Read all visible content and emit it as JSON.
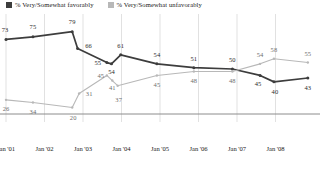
{
  "legend": {
    "position": "top-left",
    "entries": [
      {
        "label": "% Very/Somewhat favorably",
        "color": "#3d3d3d",
        "name": "favorable"
      },
      {
        "label": "% Very/Somewhat unfavorably",
        "color": "#b8b8b8",
        "name": "unfavorable"
      }
    ]
  },
  "chart_data": {
    "type": "line",
    "title": "",
    "subtitle": "",
    "xlabel": "",
    "ylabel": "",
    "grid": true,
    "xlim": [
      0,
      8
    ],
    "ylim": [
      15,
      85
    ],
    "categories": [
      "Jan '01",
      "Jan '02",
      "Jan '03",
      "Jan '04",
      "Jan '05",
      "Jan '06",
      "Jan '07",
      "Jan '08"
    ],
    "tick_labels": [
      "Jan '01",
      "Jan '02",
      "Jan '03",
      "Jan '04",
      "Jan '05",
      "Jan '06",
      "Jan '07",
      "Jan '08"
    ],
    "series": [
      {
        "name": "% Very/Somewhat favorably",
        "color": "#3d3d3d",
        "points": [
          {
            "x": 0.0,
            "y": 73,
            "label": "73",
            "lx": -1,
            "ly": -9
          },
          {
            "x": 0.7,
            "y": 75,
            "label": "75",
            "lx": 0,
            "ly": -10
          },
          {
            "x": 1.72,
            "y": 79,
            "label": "79",
            "lx": 0,
            "ly": -10
          },
          {
            "x": 1.86,
            "y": 66,
            "label": "66",
            "lx": 11,
            "ly": -2
          },
          {
            "x": 2.62,
            "y": 55,
            "label": "55",
            "lx": -9,
            "ly": 0
          },
          {
            "x": 2.74,
            "y": 54,
            "label": "54",
            "lx": 0,
            "ly": 8
          },
          {
            "x": 2.98,
            "y": 61,
            "label": "61",
            "lx": 0,
            "ly": -9
          },
          {
            "x": 3.92,
            "y": 54,
            "label": "54",
            "lx": 0,
            "ly": -9
          },
          {
            "x": 4.88,
            "y": 51,
            "label": "51",
            "lx": 0,
            "ly": -9
          },
          {
            "x": 5.88,
            "y": 50,
            "label": "50",
            "lx": 0,
            "ly": -9
          },
          {
            "x": 6.6,
            "y": 45,
            "label": "45",
            "lx": -2,
            "ly": 9
          },
          {
            "x": 6.96,
            "y": 40,
            "label": "40",
            "lx": 1,
            "ly": 10
          },
          {
            "x": 7.84,
            "y": 43,
            "label": "43",
            "lx": 0,
            "ly": 10
          }
        ]
      },
      {
        "name": "% Very/Somewhat unfavorably",
        "color": "#b8b8b8",
        "points": [
          {
            "x": 0.0,
            "y": 26,
            "label": "26",
            "lx": 0,
            "ly": 9
          },
          {
            "x": 0.7,
            "y": 24,
            "label": "34",
            "lx": 0,
            "ly": 10
          },
          {
            "x": 1.72,
            "y": 20,
            "label": "20",
            "lx": 1,
            "ly": 10
          },
          {
            "x": 1.9,
            "y": 31,
            "label": "31",
            "lx": 10,
            "ly": 1
          },
          {
            "x": 2.62,
            "y": 45,
            "label": "45",
            "lx": -6,
            "ly": 1
          },
          {
            "x": 2.76,
            "y": 41,
            "label": "41",
            "lx": 0,
            "ly": 7
          },
          {
            "x": 2.9,
            "y": 37,
            "label": "37",
            "lx": 1,
            "ly": 14
          },
          {
            "x": 3.92,
            "y": 45,
            "label": "45",
            "lx": 0,
            "ly": 10
          },
          {
            "x": 4.88,
            "y": 48,
            "label": "48",
            "lx": 0,
            "ly": 9
          },
          {
            "x": 5.88,
            "y": 48,
            "label": "48",
            "lx": 0,
            "ly": 9
          },
          {
            "x": 6.6,
            "y": 54,
            "label": "54",
            "lx": 0,
            "ly": -9
          },
          {
            "x": 6.96,
            "y": 58,
            "label": "58",
            "lx": 0,
            "ly": -9
          },
          {
            "x": 7.84,
            "y": 55,
            "label": "55",
            "lx": 0,
            "ly": -9
          }
        ]
      }
    ]
  },
  "axis": {
    "line_color": "#8c8c8c",
    "grid_color": "#d9d9d9"
  }
}
